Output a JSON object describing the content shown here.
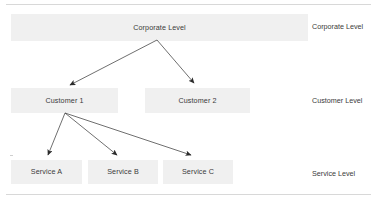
{
  "diagram": {
    "type": "hierarchy-tree",
    "colors": {
      "node_fill": "#f0f0f0",
      "text": "#3a3a3a",
      "arrow": "#2b2b2b",
      "rule": "#d8d8d8",
      "background": "#ffffff"
    },
    "levels": [
      {
        "id": "corporate",
        "side_label": "Corporate Level",
        "nodes": [
          {
            "id": "corporate-level",
            "label": "Corporate Level"
          }
        ]
      },
      {
        "id": "customer",
        "side_label": "Customer Level",
        "nodes": [
          {
            "id": "customer-1",
            "label": "Customer 1"
          },
          {
            "id": "customer-2",
            "label": "Customer 2"
          }
        ]
      },
      {
        "id": "service",
        "side_label": "Service Level",
        "nodes": [
          {
            "id": "service-a",
            "label": "Service A"
          },
          {
            "id": "service-b",
            "label": "Service B"
          },
          {
            "id": "service-c",
            "label": "Service C"
          }
        ]
      }
    ],
    "edges": [
      {
        "id": "edge-corporate-customer-1",
        "from": "corporate-level",
        "to": "customer-1",
        "style": "arrow"
      },
      {
        "id": "edge-corporate-customer-2",
        "from": "corporate-level",
        "to": "customer-2",
        "style": "arrow"
      },
      {
        "id": "edge-customer1-service-a",
        "from": "customer-1",
        "to": "service-a",
        "style": "arrow"
      },
      {
        "id": "edge-customer1-service-b",
        "from": "customer-1",
        "to": "service-b",
        "style": "arrow"
      },
      {
        "id": "edge-customer1-service-c",
        "from": "customer-1",
        "to": "service-c",
        "style": "arrow"
      }
    ]
  }
}
